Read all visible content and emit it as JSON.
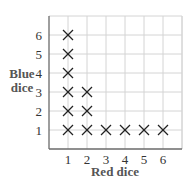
{
  "chart_data": {
    "type": "scatter",
    "title": "",
    "xlabel": "Red dice",
    "ylabel": "Blue dice",
    "ylabel_lines": [
      "Blue",
      "dice"
    ],
    "x_ticks": [
      "1",
      "2",
      "3",
      "4",
      "5",
      "6"
    ],
    "y_ticks": [
      "1",
      "2",
      "3",
      "4",
      "5",
      "6"
    ],
    "xlim": [
      0,
      7
    ],
    "ylim": [
      0,
      7
    ],
    "grid": true,
    "marker": "x",
    "points": [
      {
        "x": 1,
        "y": 1
      },
      {
        "x": 1,
        "y": 2
      },
      {
        "x": 1,
        "y": 3
      },
      {
        "x": 1,
        "y": 4
      },
      {
        "x": 1,
        "y": 5
      },
      {
        "x": 1,
        "y": 6
      },
      {
        "x": 2,
        "y": 1
      },
      {
        "x": 2,
        "y": 2
      },
      {
        "x": 2,
        "y": 3
      },
      {
        "x": 3,
        "y": 1
      },
      {
        "x": 4,
        "y": 1
      },
      {
        "x": 5,
        "y": 1
      },
      {
        "x": 6,
        "y": 1
      }
    ]
  },
  "colors": {
    "grid": "#d4d4d4",
    "axis": "#6a6a6a",
    "marker": "#222222",
    "label": "#555555"
  }
}
